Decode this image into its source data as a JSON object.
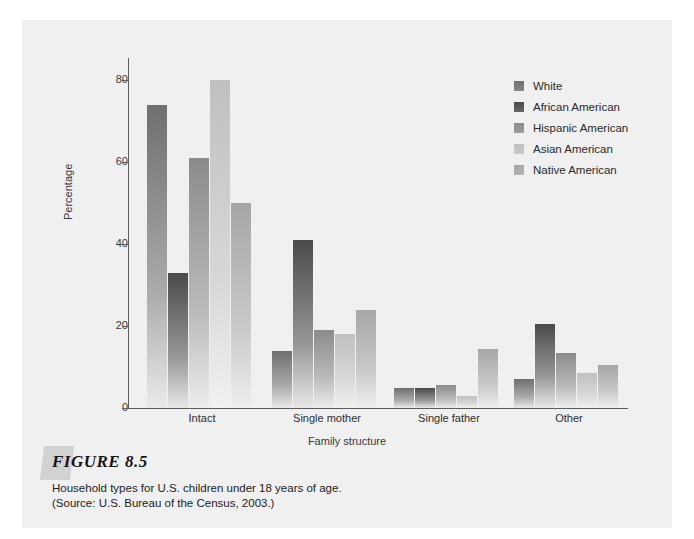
{
  "figure": {
    "tab_icon": "figure-tab-flag",
    "title": "FIGURE 8.5",
    "caption_line_1": "Household types for U.S. children under 18 years of age.",
    "caption_line_2": "(Source: U.S. Bureau of the Census, 2003.)"
  },
  "legend": {
    "entries": [
      {
        "label": "White",
        "color": "#6f6f6f"
      },
      {
        "label": "African American",
        "color": "#4a4a4a"
      },
      {
        "label": "Hispanic American",
        "color": "#8b8b8b"
      },
      {
        "label": "Asian American",
        "color": "#c0c0c0"
      },
      {
        "label": "Native American",
        "color": "#a6a6a6"
      }
    ]
  },
  "chart_data": {
    "type": "bar",
    "title": "Household types for U.S. children under 18 years of age.",
    "xlabel": "Family structure",
    "ylabel": "Percentage",
    "ylim": [
      0,
      85
    ],
    "yticks": [
      0,
      20,
      40,
      60,
      80
    ],
    "ytick_labels": [
      "0",
      "20",
      "40",
      "60",
      "80"
    ],
    "grid": false,
    "legend_position": "top-right",
    "categories": [
      "Intact",
      "Single mother",
      "Single father",
      "Other"
    ],
    "series": [
      {
        "name": "White",
        "color": "#6f6f6f",
        "values": [
          74,
          14,
          5,
          7
        ]
      },
      {
        "name": "African American",
        "color": "#4a4a4a",
        "values": [
          33,
          41,
          5,
          20.5
        ]
      },
      {
        "name": "Hispanic American",
        "color": "#8b8b8b",
        "values": [
          61,
          19,
          5.5,
          13.5
        ]
      },
      {
        "name": "Asian American",
        "color": "#c0c0c0",
        "values": [
          80,
          18,
          3,
          8.5
        ]
      },
      {
        "name": "Native American",
        "color": "#a6a6a6",
        "values": [
          50,
          24,
          14.5,
          10.5
        ]
      }
    ]
  }
}
